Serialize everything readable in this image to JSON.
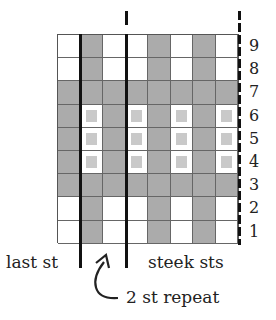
{
  "chart_title": "",
  "colors": {
    "contrast": "#ababab",
    "main": "#ffffff",
    "pattern_dot": "#c9c9c9",
    "lines": "#111111"
  },
  "legend_key": {
    "D": "contrast color stitch",
    "W": "main color stitch",
    "P": "main color with pattern dot"
  },
  "rows": [
    {
      "number": "9",
      "cells": [
        "W",
        "D",
        "W",
        "W",
        "D",
        "W",
        "D",
        "W"
      ]
    },
    {
      "number": "8",
      "cells": [
        "W",
        "D",
        "W",
        "W",
        "D",
        "W",
        "D",
        "W"
      ]
    },
    {
      "number": "7",
      "cells": [
        "D",
        "D",
        "D",
        "D",
        "D",
        "D",
        "D",
        "D"
      ]
    },
    {
      "number": "6",
      "cells": [
        "D",
        "P",
        "D",
        "P",
        "D",
        "P",
        "D",
        "P"
      ]
    },
    {
      "number": "5",
      "cells": [
        "D",
        "P",
        "D",
        "P",
        "D",
        "P",
        "D",
        "P"
      ]
    },
    {
      "number": "4",
      "cells": [
        "D",
        "P",
        "D",
        "P",
        "D",
        "P",
        "D",
        "P"
      ]
    },
    {
      "number": "3",
      "cells": [
        "D",
        "D",
        "D",
        "D",
        "D",
        "D",
        "D",
        "D"
      ]
    },
    {
      "number": "2",
      "cells": [
        "W",
        "D",
        "W",
        "W",
        "D",
        "W",
        "D",
        "W"
      ]
    },
    {
      "number": "1",
      "cells": [
        "W",
        "D",
        "W",
        "W",
        "D",
        "W",
        "D",
        "W"
      ]
    }
  ],
  "labels": {
    "last_st": "last st",
    "steek_sts": "steek sts",
    "repeat": "2 st repeat"
  }
}
